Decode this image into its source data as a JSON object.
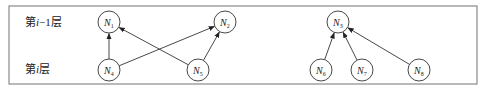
{
  "frame": {
    "x": 9,
    "y": 6,
    "w": 468,
    "h": 78,
    "stroke": "#8a8a8a"
  },
  "layers": [
    {
      "id": "upper",
      "label": "第i−1层",
      "label_prefix": "第",
      "label_var": "i",
      "label_suffix": "−1层",
      "x": 25,
      "y": 26
    },
    {
      "id": "lower",
      "label": "第i层",
      "label_prefix": "第",
      "label_var": "i",
      "label_suffix": "层",
      "x": 25,
      "y": 73
    }
  ],
  "nodes": [
    {
      "id": "N1",
      "name": "N",
      "sub": "1",
      "x": 109,
      "y": 22
    },
    {
      "id": "N2",
      "name": "N",
      "sub": "2",
      "x": 225,
      "y": 22
    },
    {
      "id": "N3",
      "name": "N",
      "sub": "3",
      "x": 338,
      "y": 22
    },
    {
      "id": "N4",
      "name": "N",
      "sub": "4",
      "x": 109,
      "y": 70
    },
    {
      "id": "N5",
      "name": "N",
      "sub": "5",
      "x": 198,
      "y": 70
    },
    {
      "id": "N6",
      "name": "N",
      "sub": "6",
      "x": 321,
      "y": 70
    },
    {
      "id": "N7",
      "name": "N",
      "sub": "7",
      "x": 362,
      "y": 70
    },
    {
      "id": "N8",
      "name": "N",
      "sub": "8",
      "x": 419,
      "y": 70
    }
  ],
  "edges": [
    {
      "from": "N4",
      "to": "N1"
    },
    {
      "from": "N4",
      "to": "N2"
    },
    {
      "from": "N5",
      "to": "N1"
    },
    {
      "from": "N5",
      "to": "N2"
    },
    {
      "from": "N6",
      "to": "N3"
    },
    {
      "from": "N7",
      "to": "N3"
    },
    {
      "from": "N8",
      "to": "N3"
    }
  ],
  "node_radius": 11
}
